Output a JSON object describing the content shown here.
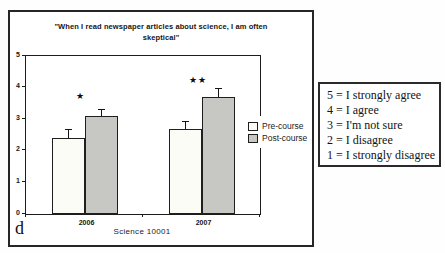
{
  "figure_label": "d",
  "chart_data": {
    "type": "bar",
    "title": "\"When I read newspaper articles about science, I am often skeptical\"",
    "title_lines": [
      "\"When I read newspaper articles about science, I am often",
      "skeptical\""
    ],
    "categories": [
      "2006",
      "2007"
    ],
    "series": [
      {
        "name": "Pre-course",
        "values": [
          2.4,
          2.7
        ],
        "errors": [
          0.28,
          0.25
        ],
        "color": "#fcfcf6"
      },
      {
        "name": "Post-course",
        "values": [
          3.1,
          3.7
        ],
        "errors": [
          0.23,
          0.28
        ],
        "color": "#c7c7c3"
      }
    ],
    "significance": [
      {
        "category": "2006",
        "label": "★",
        "y": 3.73
      },
      {
        "category": "2007",
        "label": "★★",
        "y": 4.24
      }
    ],
    "xlabel": "Science 10001",
    "ylabel": "",
    "ylim": [
      0,
      5
    ],
    "yticks": [
      0,
      1,
      2,
      3,
      4,
      5
    ],
    "grid": false,
    "legend_position": "right-of-plot",
    "bar_border_color": "#1f1f1f"
  },
  "annotation_box": {
    "lines": [
      "5 = I strongly agree",
      "4 = I agree",
      "3 = I'm not sure",
      "2 = I disagree",
      "1 = I strongly disagree"
    ]
  }
}
